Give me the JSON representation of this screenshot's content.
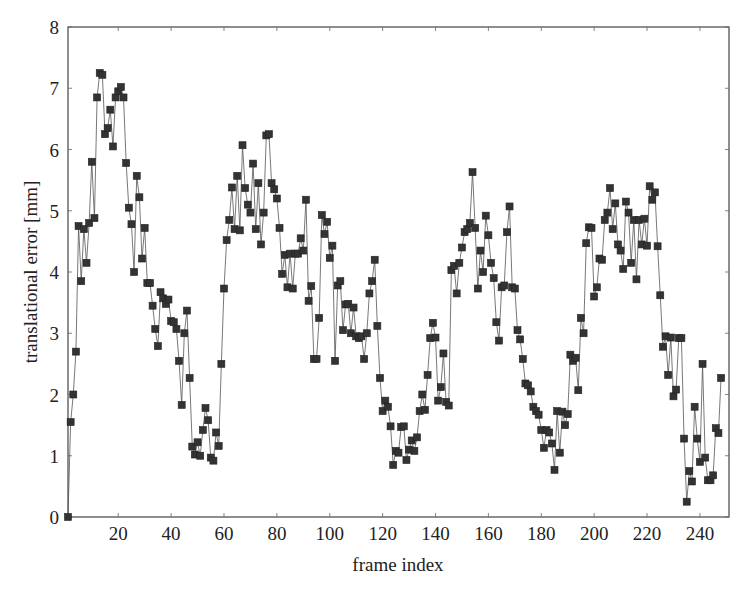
{
  "chart_data": {
    "type": "line",
    "title": "",
    "xlabel": "frame index",
    "ylabel": "translational error [mm]",
    "xlim": [
      1,
      251
    ],
    "ylim": [
      0,
      8
    ],
    "xticks": [
      20,
      40,
      60,
      80,
      100,
      120,
      140,
      160,
      180,
      200,
      220,
      240
    ],
    "yticks": [
      0,
      1,
      2,
      3,
      4,
      5,
      6,
      7,
      8
    ],
    "grid": false,
    "legend": null,
    "marker": "square",
    "series": [
      {
        "name": "translational error",
        "color": "#333333",
        "x_start": 1,
        "x_step": 1,
        "values": [
          0.0,
          1.55,
          2.0,
          2.7,
          4.75,
          3.85,
          4.7,
          4.15,
          4.8,
          5.8,
          4.88,
          6.85,
          7.25,
          7.22,
          6.25,
          6.35,
          6.65,
          6.05,
          6.85,
          6.95,
          7.02,
          6.85,
          5.78,
          5.05,
          4.78,
          4.0,
          5.57,
          5.22,
          4.22,
          4.72,
          3.82,
          3.82,
          3.45,
          3.07,
          2.79,
          3.67,
          3.57,
          3.48,
          3.55,
          3.2,
          3.18,
          3.07,
          2.55,
          1.83,
          3.0,
          3.37,
          2.27,
          1.15,
          1.02,
          1.22,
          1.0,
          1.42,
          1.78,
          1.58,
          0.97,
          0.92,
          1.38,
          1.16,
          2.5,
          3.73,
          4.52,
          4.85,
          5.38,
          4.7,
          5.57,
          4.68,
          6.07,
          5.37,
          5.1,
          4.97,
          5.77,
          4.7,
          5.45,
          4.45,
          4.97,
          6.23,
          6.25,
          5.45,
          5.35,
          5.2,
          4.72,
          3.97,
          4.28,
          3.75,
          4.3,
          3.73,
          4.3,
          4.3,
          4.55,
          4.35,
          5.18,
          3.53,
          3.77,
          2.58,
          2.58,
          3.25,
          4.93,
          4.62,
          4.82,
          4.23,
          4.43,
          2.55,
          3.78,
          3.85,
          3.05,
          3.47,
          3.48,
          3.0,
          3.42,
          2.95,
          2.92,
          2.95,
          2.58,
          3.0,
          3.65,
          3.85,
          4.2,
          3.12,
          2.27,
          1.73,
          1.9,
          1.8,
          1.48,
          0.85,
          1.08,
          1.05,
          1.47,
          1.48,
          0.93,
          1.1,
          1.25,
          1.08,
          1.3,
          1.73,
          2.0,
          1.75,
          2.32,
          2.92,
          3.17,
          2.93,
          1.9,
          2.12,
          2.67,
          1.88,
          1.82,
          4.03,
          4.1,
          3.65,
          4.15,
          4.4,
          4.65,
          4.7,
          4.8,
          5.63,
          4.72,
          3.73,
          4.35,
          4.0,
          4.92,
          4.6,
          4.15,
          3.9,
          3.18,
          2.88,
          3.75,
          3.78,
          4.65,
          5.07,
          3.75,
          3.73,
          3.05,
          2.9,
          2.58,
          2.18,
          2.15,
          2.05,
          1.8,
          1.73,
          1.67,
          1.42,
          1.13,
          1.42,
          1.38,
          1.2,
          0.77,
          1.73,
          1.05,
          1.72,
          1.5,
          1.68,
          2.65,
          2.55,
          2.6,
          2.07,
          3.25,
          3.0,
          4.47,
          4.73,
          4.72,
          3.6,
          3.75,
          4.22,
          4.2,
          4.85,
          4.97,
          5.37,
          4.7,
          5.12,
          4.45,
          4.35,
          4.05,
          5.15,
          4.97,
          4.15,
          4.85,
          3.88,
          4.85,
          4.45,
          4.87,
          4.43,
          5.4,
          5.18,
          5.3,
          4.42,
          3.62,
          2.78,
          2.95,
          2.32,
          2.93,
          1.97,
          2.08,
          2.92,
          2.92,
          1.28,
          0.25,
          0.75,
          0.58,
          1.8,
          1.28,
          0.9,
          2.5,
          0.97,
          0.6,
          0.6,
          0.68,
          1.45,
          1.37,
          2.27
        ]
      }
    ]
  }
}
